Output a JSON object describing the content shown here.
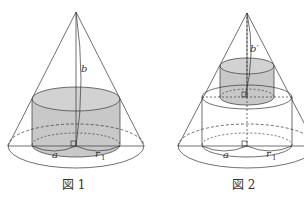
{
  "figures": [
    {
      "caption": "図 1",
      "labels": {
        "height": "b",
        "left_radius": "a",
        "right_radius": "r",
        "right_radius_sub": "1"
      }
    },
    {
      "caption": "図 2",
      "labels": {
        "height": "b′",
        "left_radius": "a",
        "right_radius": "r",
        "right_radius_sub": "1"
      }
    }
  ],
  "colors": {
    "line": "#333333",
    "fill": "#c8c8c8"
  }
}
